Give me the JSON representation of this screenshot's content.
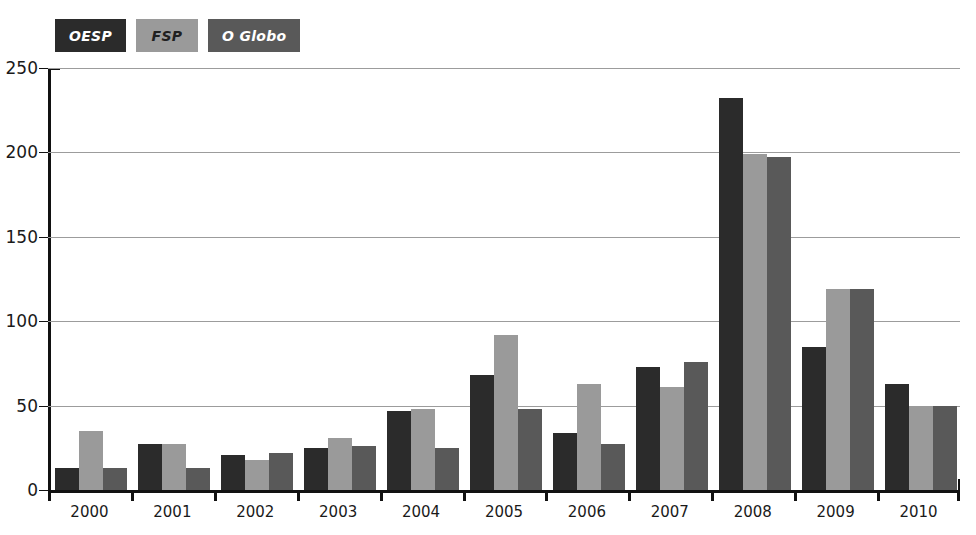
{
  "chart_data": {
    "type": "bar",
    "title": "",
    "subtitle": "",
    "xlabel": "",
    "ylabel": "",
    "ylim": [
      0,
      250
    ],
    "yticks": [
      0,
      50,
      100,
      150,
      200,
      250
    ],
    "grid": true,
    "legend_position": "top-left",
    "categories": [
      "2000",
      "2001",
      "2002",
      "2003",
      "2004",
      "2005",
      "2006",
      "2007",
      "2008",
      "2009",
      "2010"
    ],
    "series": [
      {
        "name": "OESP",
        "color": "#2b2b2b",
        "values": [
          13,
          27,
          21,
          25,
          47,
          68,
          34,
          73,
          232,
          85,
          63
        ]
      },
      {
        "name": "FSP",
        "color": "#9a9a9a",
        "values": [
          35,
          27,
          18,
          31,
          48,
          92,
          63,
          61,
          199,
          119,
          50
        ]
      },
      {
        "name": "O Globo",
        "color": "#595959",
        "values": [
          13,
          13,
          22,
          26,
          25,
          48,
          27,
          76,
          197,
          119,
          50
        ]
      }
    ]
  },
  "legend": {
    "items": [
      {
        "label": "OESP",
        "box_color": "#2b2b2b",
        "text_color": "#ffffff"
      },
      {
        "label": "FSP",
        "box_color": "#9a9a9a",
        "text_color": "#202020"
      },
      {
        "label": "O Globo",
        "box_color": "#595959",
        "text_color": "#ffffff"
      }
    ]
  },
  "axes": {
    "y_tick_labels": [
      "250",
      "200",
      "150",
      "100",
      "50",
      "0"
    ],
    "x_tick_labels": [
      "2000",
      "2001",
      "2002",
      "2003",
      "2004",
      "2005",
      "2006",
      "2007",
      "2008",
      "2009",
      "2010"
    ]
  },
  "colors": {
    "axis": "#111111",
    "gridline": "#9c9c9c",
    "background": "#ffffff"
  }
}
